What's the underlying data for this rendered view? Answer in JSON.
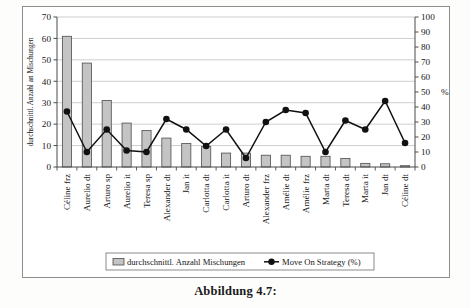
{
  "caption": "Abbildung 4.7:",
  "chart_data": {
    "type": "bar",
    "title": "",
    "subtitle": "",
    "xlabel": "",
    "ylabel": "durchschnittl. Anzahl an Mischungen",
    "y2label": "%",
    "ylim": [
      0,
      70
    ],
    "y2lim": [
      0,
      100
    ],
    "yticks": [
      0,
      10,
      20,
      30,
      40,
      50,
      60,
      70
    ],
    "y2ticks": [
      0,
      10,
      20,
      30,
      40,
      50,
      60,
      70,
      80,
      90,
      100
    ],
    "grid": true,
    "legend_position": "bottom",
    "categories": [
      "Céline frz",
      "Aurelio dt",
      "Arturo sp",
      "Aurelio it",
      "Teresa sp",
      "Alexander dt",
      "Jan it",
      "Carlotta dt",
      "Carlotta it",
      "Arturo dt",
      "Alexander frz",
      "Amélie dt",
      "Amélie frz",
      "Marta dt",
      "Teresa dt",
      "Marta it",
      "Jan dt",
      "Céline dt"
    ],
    "series": [
      {
        "name": "durchschnittl. Anzahl Mischungen",
        "type": "bar",
        "axis": "left",
        "color": "#c4c4c4",
        "edgecolor": "#4d4d4d",
        "values": [
          61,
          48.5,
          31,
          20.5,
          17,
          13.5,
          11,
          9.5,
          6.5,
          6.5,
          5.5,
          5.5,
          5,
          5,
          4,
          1.7,
          1.5,
          0.6
        ]
      },
      {
        "name": "Move On Strategy (%)",
        "type": "line",
        "axis": "right",
        "color": "#111111",
        "marker": "circle",
        "values": [
          37,
          10,
          25,
          11,
          10,
          32,
          25,
          14,
          25,
          6,
          30,
          38,
          36,
          10,
          31,
          25,
          44,
          16
        ]
      }
    ]
  },
  "legend": {
    "items": [
      {
        "label": "durchschnittl. Anzahl Mischungen",
        "marker": "bar-swatch"
      },
      {
        "label": "Move On Strategy (%)",
        "marker": "line-dot"
      }
    ]
  }
}
